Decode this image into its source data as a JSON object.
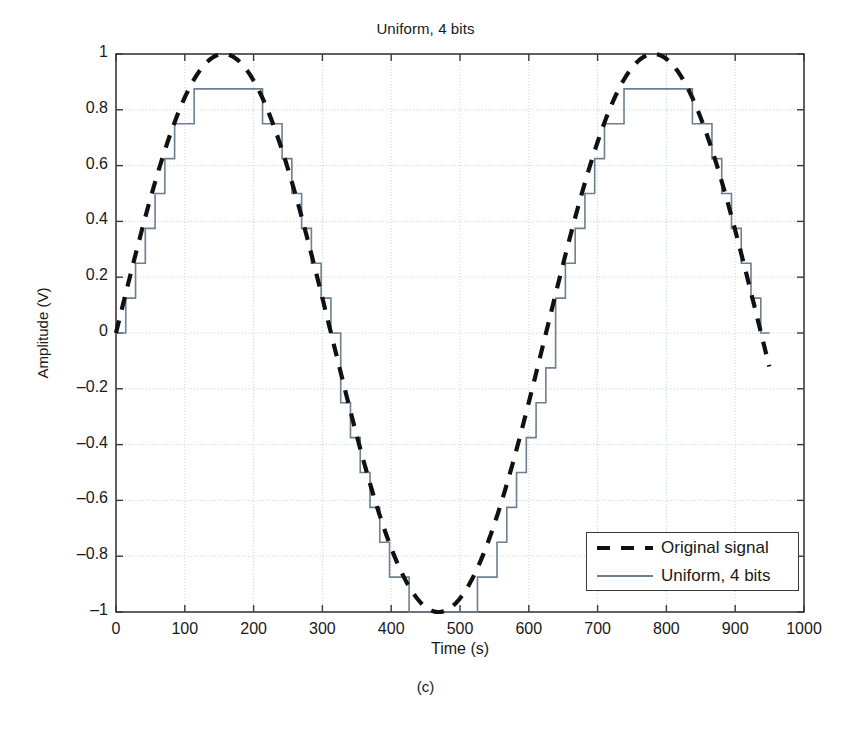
{
  "chart_data": {
    "type": "line",
    "title": "Uniform, 4 bits",
    "xlabel": "Time (s)",
    "ylabel": "Amplitude (V)",
    "caption": "(c)",
    "xlim": [
      0,
      1000
    ],
    "ylim": [
      -1,
      1
    ],
    "xticks": [
      0,
      100,
      200,
      300,
      400,
      500,
      600,
      700,
      800,
      900,
      1000
    ],
    "xtick_labels": [
      "0",
      "100",
      "200",
      "300",
      "400",
      "500",
      "600",
      "700",
      "800",
      "900",
      "1000"
    ],
    "yticks": [
      -1,
      -0.8,
      -0.6,
      -0.4,
      -0.2,
      0,
      0.2,
      0.4,
      0.6,
      0.8,
      1
    ],
    "ytick_labels": [
      "-1",
      "-0.8",
      "-0.6",
      "-0.4",
      "-0.2",
      "0",
      "0.2",
      "0.4",
      "0.6",
      "0.8",
      "1"
    ],
    "grid": true,
    "legend_position": "lower-right",
    "signal": {
      "form": "sine",
      "amplitude": 1,
      "period_s": 625,
      "phase_deg": 0,
      "t_start": 0,
      "t_end": 950,
      "sample_interval_s": 14.2
    },
    "quantizer": {
      "name": "Uniform, 4 bits",
      "bits": 4,
      "levels": 16,
      "step_size": 0.125,
      "max_level": 0.875,
      "min_level": -1.0
    },
    "series": [
      {
        "name": "Original signal",
        "style": "dashed",
        "color": "#111111",
        "width": 4
      },
      {
        "name": "Uniform, 4 bits",
        "style": "solid-staircase",
        "color": "#6e7f90",
        "width": 1.6
      }
    ],
    "colors": {
      "grid": "#c8d4e2",
      "axis": "#3a3a3a",
      "background": "#ffffff",
      "original_signal": "#111111",
      "quantized_signal": "#6e7f90"
    }
  }
}
